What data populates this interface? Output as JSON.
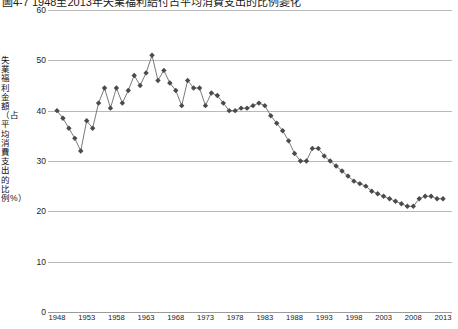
{
  "figure": {
    "caption_fragment": "圖4-7 1948至2013年失業福利給付占平均消費支出的比例變化"
  },
  "chart_data": {
    "type": "line",
    "title": "",
    "xlabel": "",
    "ylabel": "失業福利金額（占平均消費支出的比例%）",
    "ylim": [
      0,
      60
    ],
    "ytick_values": [
      0,
      10,
      20,
      30,
      40,
      50,
      60
    ],
    "xlim": [
      1948,
      2013
    ],
    "xtick_values": [
      1948,
      1953,
      1958,
      1963,
      1968,
      1973,
      1978,
      1983,
      1988,
      1993,
      1998,
      2003,
      2008,
      2013
    ],
    "grid": "horizontal",
    "legend": "none",
    "marker": "diamond",
    "marker_color": "#4a4a4a",
    "line_color": "#6b6b6b",
    "x": [
      1948,
      1949,
      1950,
      1951,
      1952,
      1953,
      1954,
      1955,
      1956,
      1957,
      1958,
      1959,
      1960,
      1961,
      1962,
      1963,
      1964,
      1965,
      1966,
      1967,
      1968,
      1969,
      1970,
      1971,
      1972,
      1973,
      1974,
      1975,
      1976,
      1977,
      1978,
      1979,
      1980,
      1981,
      1982,
      1983,
      1984,
      1985,
      1986,
      1987,
      1988,
      1989,
      1990,
      1991,
      1992,
      1993,
      1994,
      1995,
      1996,
      1997,
      1998,
      1999,
      2000,
      2001,
      2002,
      2003,
      2004,
      2005,
      2006,
      2007,
      2008,
      2009,
      2010,
      2011,
      2012,
      2013
    ],
    "values": [
      40.0,
      38.5,
      36.5,
      34.5,
      32.0,
      38.0,
      36.5,
      41.5,
      44.5,
      40.5,
      44.5,
      41.5,
      44.0,
      47.0,
      45.0,
      47.5,
      51.0,
      46.0,
      48.0,
      45.5,
      44.0,
      41.0,
      46.0,
      44.5,
      44.5,
      41.0,
      43.5,
      43.0,
      41.5,
      40.0,
      40.0,
      40.5,
      40.5,
      41.0,
      41.5,
      41.0,
      39.0,
      37.5,
      36.0,
      34.0,
      31.5,
      30.0,
      30.0,
      32.5,
      32.5,
      31.0,
      30.0,
      29.0,
      28.0,
      27.0,
      26.0,
      25.5,
      25.0,
      24.0,
      23.5,
      23.0,
      22.5,
      22.0,
      21.5,
      21.0,
      21.0,
      22.5,
      23.0,
      23.0,
      22.5,
      22.5
    ],
    "series_name": "失業福利給付占平均消費支出比例"
  }
}
